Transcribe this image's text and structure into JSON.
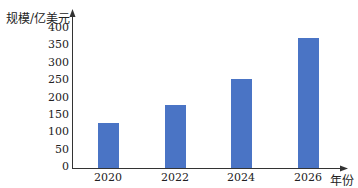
{
  "chart_data": {
    "type": "bar",
    "title": "",
    "xlabel": "年份",
    "ylabel": "规模/亿美元",
    "categories": [
      "2020",
      "2022",
      "2024",
      "2026"
    ],
    "values": [
      130,
      180,
      255,
      375
    ],
    "yticks": [
      0,
      50,
      100,
      150,
      200,
      250,
      300,
      350,
      400
    ],
    "ylim": [
      0,
      400
    ],
    "grid": false,
    "legend": null,
    "bar_color": "#4a74c5"
  }
}
